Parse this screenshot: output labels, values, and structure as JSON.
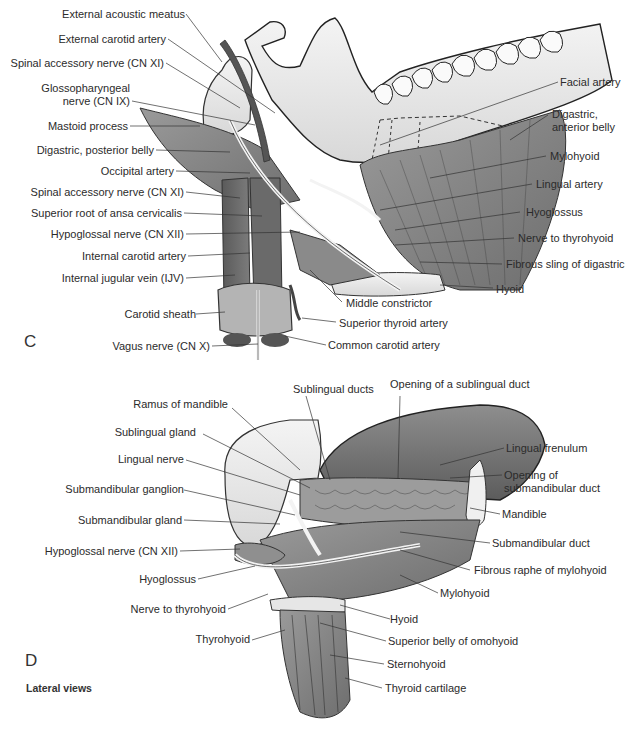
{
  "figure": {
    "panels": [
      {
        "letter": "C",
        "labels_left": [
          "External acoustic meatus",
          "External carotid artery",
          "Spinal accessory nerve (CN XI)",
          "Glossopharyngeal",
          "nerve (CN IX)",
          "Mastoid process",
          "Digastric, posterior belly",
          "Occipital artery",
          "Spinal accessory nerve (CN XI)",
          "Superior root of ansa cervicalis",
          "Hypoglossal nerve (CN XII)",
          "Internal carotid artery",
          "Internal jugular vein (IJV)",
          "Carotid sheath",
          "Vagus nerve (CN X)"
        ],
        "labels_right": [
          "Facial artery",
          "Digastric,",
          "anterior belly",
          "Mylohyoid",
          "Lingual artery",
          "Hyoglossus",
          "Nerve to thyrohyoid",
          "Fibrous sling of digastric",
          "Hyoid"
        ],
        "labels_bottom": [
          "Middle constrictor",
          "Superior thyroid artery",
          "Common carotid artery"
        ]
      },
      {
        "letter": "D",
        "labels_top": [
          "Sublingual ducts",
          "Opening of a sublingual duct"
        ],
        "labels_left": [
          "Ramus of mandible",
          "Sublingual gland",
          "Lingual nerve",
          "Submandibular ganglion",
          "Submandibular gland",
          "Hypoglossal nerve (CN XII)",
          "Hyoglossus",
          "Nerve to thyrohyoid",
          "Thyrohyoid"
        ],
        "labels_right": [
          "Lingual frenulum",
          "Opening of",
          "submandibular duct",
          "Mandible",
          "Submandibular duct",
          "Fibrous raphe of mylohyoid",
          "Mylohyoid",
          "Hyoid",
          "Superior belly of omohyoid",
          "Sternohyoid",
          "Thyroid cartilage"
        ]
      }
    ],
    "caption": "Lateral views"
  }
}
